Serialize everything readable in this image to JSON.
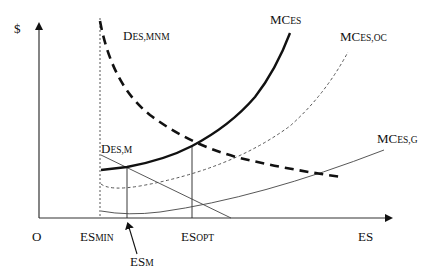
{
  "diagram": {
    "type": "economic-cost-demand-diagram",
    "y_axis_label": "$",
    "x_axis_label": "ES",
    "origin_label": "O",
    "x_markers": [
      {
        "id": "es_min",
        "main": "ES",
        "sub": "MIN"
      },
      {
        "id": "es_opt",
        "main": "ES",
        "sub": "OPT"
      },
      {
        "id": "es_m",
        "main": "ES",
        "sub": "M"
      }
    ],
    "curves": [
      {
        "id": "mc_es",
        "main": "MC",
        "sub": "ES",
        "style": "thick-solid"
      },
      {
        "id": "mc_es_oc",
        "main": "MC",
        "sub": "ES,OC",
        "style": "thin-dashed"
      },
      {
        "id": "mc_es_g",
        "main": "MC",
        "sub": "ES,G",
        "style": "thin-solid"
      },
      {
        "id": "d_es_mnm",
        "main": "D",
        "sub": "ES,MNM",
        "style": "thick-dashed"
      },
      {
        "id": "d_es_m",
        "main": "D",
        "sub": "ES,M",
        "style": "thin-solid"
      }
    ],
    "colors": {
      "ink": "#111111",
      "thin_line": "#444444",
      "background": "#ffffff"
    }
  }
}
